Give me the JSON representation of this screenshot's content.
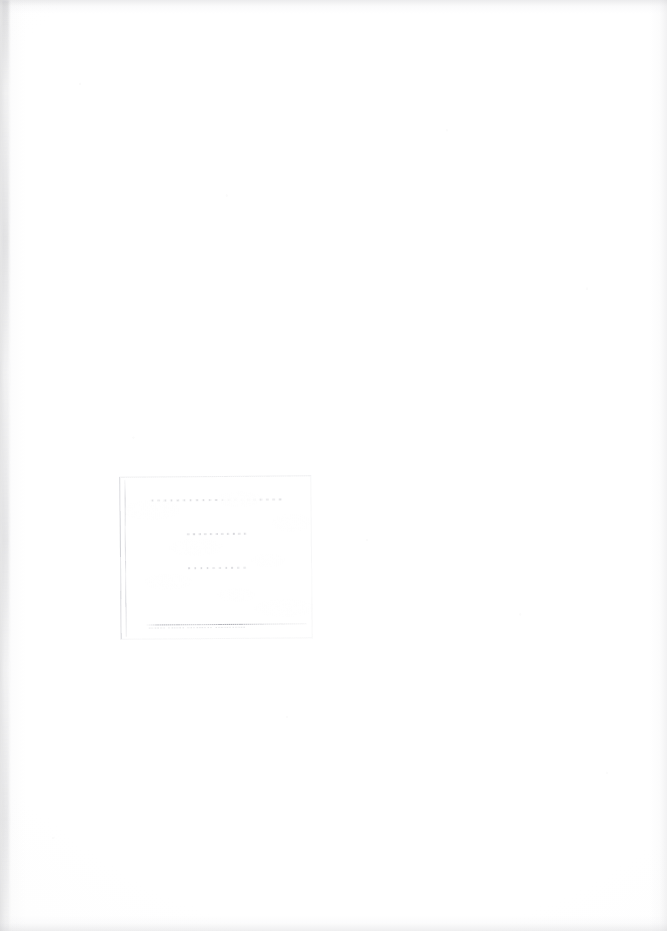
{
  "document": {
    "kind": "scanned-page",
    "page_state": "blank",
    "width_px": 667,
    "height_px": 931,
    "background_color": "#ffffff",
    "paper_tone": "#fdfdfd"
  },
  "stamp": {
    "present": true,
    "type": "rectangular-ink-stamp",
    "legibility": "illegible",
    "ink_color": "#54566 8",
    "position": {
      "left_px": 120,
      "top_px": 476,
      "width_px": 192,
      "height_px": 163
    },
    "rotation_deg": -0.5,
    "lines": [
      {
        "id": "line-1",
        "text": "·····················",
        "readable": false
      },
      {
        "id": "line-2",
        "text": "···········",
        "readable": false
      },
      {
        "id": "line-3",
        "text": "··········",
        "readable": false
      }
    ],
    "fineprint": "······ ······ ········· ···········",
    "fineprint_readable": false,
    "has_bottom_rule": true
  },
  "scan_artifacts": {
    "left_edge_shadow": true,
    "right_edge_shadow": true,
    "top_edge_shadow": true,
    "bottom_edge_shadow": true,
    "speckle": true
  }
}
